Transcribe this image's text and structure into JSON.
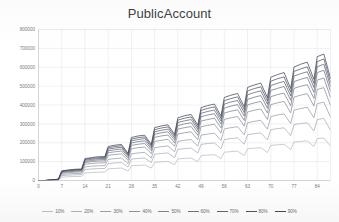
{
  "chart_data": {
    "type": "line",
    "title": "PublicAccount",
    "xlabel": "",
    "ylabel": "",
    "xlim": [
      0,
      88
    ],
    "ylim": [
      0,
      800000
    ],
    "grid": true,
    "legend_position": "bottom",
    "y_ticks": [
      0,
      100000,
      200000,
      300000,
      400000,
      500000,
      600000,
      700000,
      800000
    ],
    "y_tick_labels": [
      "0",
      "100000",
      "200000",
      "300000",
      "400000",
      "500000",
      "600000",
      "700000",
      "800000"
    ],
    "x_ticks": [
      0,
      7,
      14,
      21,
      28,
      35,
      42,
      49,
      56,
      63,
      70,
      77,
      84
    ],
    "x_tick_labels": [
      "0",
      "7",
      "14",
      "21",
      "28",
      "35",
      "42",
      "49",
      "56",
      "63",
      "70",
      "77",
      "84"
    ],
    "x": [
      0,
      2,
      4,
      6,
      7,
      9,
      11,
      13,
      14,
      16,
      18,
      20,
      21,
      23,
      25,
      27,
      28,
      30,
      32,
      34,
      35,
      37,
      39,
      41,
      42,
      44,
      46,
      48,
      49,
      51,
      53,
      55,
      56,
      58,
      60,
      62,
      63,
      65,
      67,
      69,
      70,
      72,
      74,
      76,
      77,
      79,
      81,
      83,
      84,
      86,
      88
    ],
    "series": [
      {
        "name": "10%",
        "color": "#b9bcc4",
        "values": [
          0,
          0,
          1000,
          2000,
          18000,
          20000,
          21000,
          22000,
          40000,
          42000,
          44000,
          45000,
          62000,
          64000,
          66000,
          50000,
          78000,
          80000,
          82000,
          66000,
          96000,
          99000,
          101000,
          84000,
          114000,
          117000,
          119000,
          100000,
          132000,
          135000,
          137000,
          116000,
          150000,
          153000,
          156000,
          132000,
          168000,
          171000,
          174000,
          148000,
          186000,
          189000,
          192000,
          164000,
          204000,
          207000,
          210000,
          180000,
          222000,
          225000,
          182000
        ]
      },
      {
        "name": "20%",
        "color": "#a9adb6",
        "values": [
          0,
          0,
          1500,
          3000,
          26000,
          28500,
          30000,
          31000,
          58000,
          61000,
          63000,
          64000,
          90000,
          93000,
          95000,
          72000,
          113000,
          117000,
          119000,
          95000,
          139000,
          143000,
          146000,
          121000,
          165000,
          169000,
          172000,
          145000,
          191000,
          196000,
          199000,
          168000,
          217000,
          222000,
          226000,
          192000,
          243000,
          248000,
          252000,
          215000,
          269000,
          275000,
          279000,
          238000,
          296000,
          302000,
          306000,
          262000,
          323000,
          329000,
          266000
        ]
      },
      {
        "name": "30%",
        "color": "#9a9ea8",
        "values": [
          0,
          0,
          2000,
          4000,
          32000,
          35000,
          37000,
          38000,
          72000,
          76000,
          78000,
          79000,
          112000,
          116000,
          119000,
          90000,
          141000,
          146000,
          149000,
          119000,
          174000,
          179000,
          183000,
          152000,
          207000,
          213000,
          217000,
          182000,
          240000,
          246000,
          251000,
          212000,
          273000,
          280000,
          285000,
          242000,
          306000,
          313000,
          319000,
          272000,
          339000,
          347000,
          353000,
          302000,
          373000,
          381000,
          388000,
          332000,
          407000,
          415000,
          336000
        ]
      },
      {
        "name": "40%",
        "color": "#8b8f9a",
        "values": [
          0,
          0,
          2500,
          5000,
          38000,
          41500,
          44000,
          45000,
          86000,
          90000,
          93000,
          94000,
          133000,
          138000,
          141000,
          107000,
          168000,
          174000,
          177000,
          142000,
          207000,
          213000,
          218000,
          181000,
          246000,
          253000,
          258000,
          216000,
          285000,
          292000,
          298000,
          252000,
          324000,
          332000,
          339000,
          288000,
          363000,
          372000,
          379000,
          323000,
          402000,
          411000,
          419000,
          358000,
          442000,
          452000,
          460000,
          394000,
          482000,
          492000,
          398000
        ]
      },
      {
        "name": "50%",
        "color": "#7c818d",
        "values": [
          0,
          0,
          2800,
          5600,
          42000,
          46000,
          48500,
          50000,
          95000,
          100000,
          103000,
          104000,
          147000,
          152000,
          156000,
          118000,
          186000,
          192000,
          196000,
          157000,
          229000,
          236000,
          241000,
          200000,
          272000,
          280000,
          286000,
          239000,
          315000,
          323000,
          330000,
          279000,
          358000,
          367000,
          375000,
          318000,
          401000,
          411000,
          419000,
          357000,
          444000,
          455000,
          463000,
          396000,
          488000,
          499000,
          508000,
          435000,
          532000,
          543000,
          440000
        ]
      },
      {
        "name": "60%",
        "color": "#6d727f",
        "values": [
          0,
          0,
          3000,
          6000,
          45000,
          49000,
          52000,
          53500,
          101000,
          106000,
          110000,
          111000,
          157000,
          163000,
          167000,
          126000,
          199000,
          206000,
          210000,
          168000,
          245000,
          253000,
          258000,
          214000,
          291000,
          300000,
          306000,
          256000,
          338000,
          347000,
          354000,
          299000,
          384000,
          394000,
          402000,
          341000,
          430000,
          441000,
          450000,
          383000,
          477000,
          488000,
          498000,
          425000,
          524000,
          536000,
          546000,
          467000,
          572000,
          584000,
          473000
        ]
      },
      {
        "name": "70%",
        "color": "#5e6372",
        "values": [
          0,
          0,
          3200,
          6400,
          47500,
          52000,
          55000,
          56500,
          107000,
          112000,
          116000,
          117000,
          166000,
          172000,
          176000,
          133000,
          210000,
          217000,
          222000,
          177000,
          258000,
          266000,
          272000,
          226000,
          307000,
          316000,
          323000,
          270000,
          356000,
          366000,
          373000,
          315000,
          405000,
          416000,
          424000,
          360000,
          454000,
          466000,
          475000,
          404000,
          503000,
          515000,
          525000,
          448000,
          553000,
          566000,
          576000,
          493000,
          603000,
          616000,
          499000
        ]
      },
      {
        "name": "80%",
        "color": "#4f5465",
        "values": [
          0,
          0,
          3400,
          6800,
          49500,
          54000,
          57000,
          59000,
          111500,
          117000,
          121000,
          122000,
          173000,
          180000,
          184000,
          139000,
          219000,
          227000,
          231000,
          185000,
          269000,
          278000,
          284000,
          236000,
          320000,
          330000,
          337000,
          282000,
          372000,
          382000,
          390000,
          329000,
          423000,
          434000,
          443000,
          376000,
          474000,
          487000,
          496000,
          422000,
          526000,
          539000,
          549000,
          468000,
          578000,
          591000,
          602000,
          515000,
          630000,
          644000,
          521000
        ]
      },
      {
        "name": "90%",
        "color": "#414758",
        "values": [
          0,
          0,
          3600,
          7200,
          51000,
          56000,
          59500,
          61000,
          116000,
          121500,
          126000,
          127000,
          180000,
          187000,
          191000,
          144000,
          228000,
          236000,
          240000,
          192000,
          280000,
          289000,
          295000,
          245000,
          332000,
          343000,
          350000,
          293000,
          386000,
          397000,
          405000,
          342000,
          440000,
          452000,
          461000,
          391000,
          493000,
          506000,
          516000,
          439000,
          547000,
          561000,
          572000,
          487000,
          601000,
          616000,
          627000,
          536000,
          656000,
          670000,
          542000
        ]
      }
    ]
  },
  "legend": {
    "items": [
      {
        "label": "10%"
      },
      {
        "label": "20%"
      },
      {
        "label": "30%"
      },
      {
        "label": "40%"
      },
      {
        "label": "50%"
      },
      {
        "label": "60%"
      },
      {
        "label": "70%"
      },
      {
        "label": "80%"
      },
      {
        "label": "90%"
      }
    ]
  }
}
